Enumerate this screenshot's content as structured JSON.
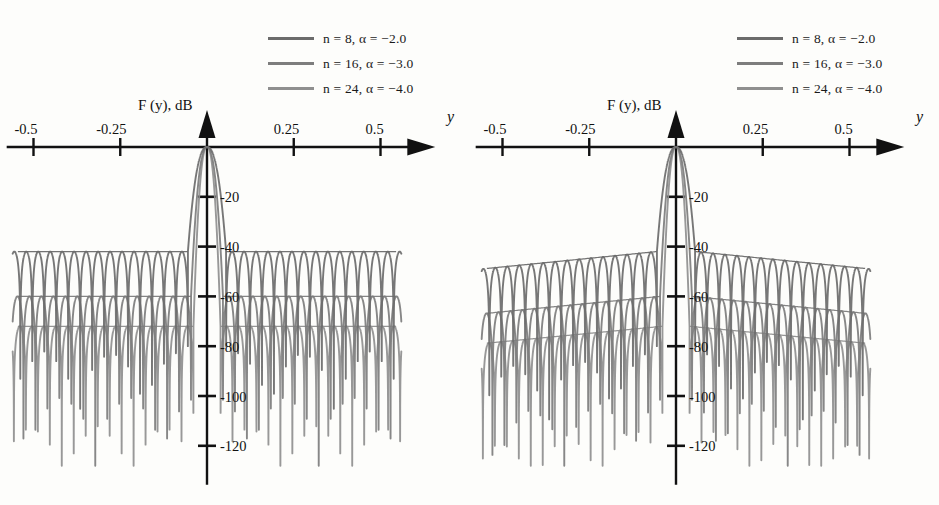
{
  "figure": {
    "background": "#fdfdfb",
    "panel_count": 2
  },
  "legend": {
    "position": "top-center-right",
    "entries": [
      {
        "label": "n = 8, α = −2.0",
        "n": 8,
        "alpha": -2.0,
        "color": "#6b6b6b"
      },
      {
        "label": "n = 16, α = −3.0",
        "n": 16,
        "alpha": -3.0,
        "color": "#7d7d7d"
      },
      {
        "label": "n = 24, α = −4.0",
        "n": 24,
        "alpha": -4.0,
        "color": "#8f8f8f"
      }
    ]
  },
  "axes": {
    "ylabel": "F (y), dB",
    "xlabel": "y",
    "xticks": [
      "-0.5",
      "-0.25",
      "0.25",
      "0.5"
    ],
    "xtick_values": [
      -0.5,
      -0.25,
      0.25,
      0.5
    ],
    "yticks": [
      "-20",
      "-40",
      "-60",
      "-80",
      "-100",
      "-120"
    ],
    "ytick_values": [
      -20,
      -40,
      -60,
      -80,
      -100,
      -120
    ],
    "xlim": [
      -0.56,
      0.56
    ],
    "ylim": [
      -130,
      2
    ],
    "grid": false,
    "arrow_heads": true
  },
  "chart_data": [
    {
      "type": "line",
      "title": "",
      "panel": "left",
      "xlabel": "y",
      "ylabel": "F (y), dB",
      "xlim": [
        -0.56,
        0.56
      ],
      "ylim": [
        -130,
        2
      ],
      "grid": false,
      "legend_position": "top-right",
      "envelope_slope_db": 0,
      "series": [
        {
          "name": "n = 8, α = −2.0",
          "n": 8,
          "alpha": -2.0,
          "color": "#6b6b6b",
          "peak_db": 0,
          "mainlobe_half_width_y": 0.055,
          "sidelobe_level_db": -42,
          "sidelobe_envelope": "flat",
          "null_depth_db": -126,
          "sidelobe_period_y": 0.0345,
          "first_null_y": 0.055
        },
        {
          "name": "n = 16, α = −3.0",
          "n": 16,
          "alpha": -3.0,
          "color": "#7d7d7d",
          "peak_db": 0,
          "mainlobe_half_width_y": 0.046,
          "sidelobe_level_db": -60,
          "sidelobe_envelope": "flat",
          "null_depth_db": -126,
          "sidelobe_period_y": 0.0345,
          "first_null_y": 0.046
        },
        {
          "name": "n = 24, α = −4.0",
          "n": 24,
          "alpha": -4.0,
          "color": "#8f8f8f",
          "peak_db": 0,
          "mainlobe_half_width_y": 0.039,
          "sidelobe_level_db": -72,
          "sidelobe_envelope": "flat",
          "null_depth_db": -126,
          "sidelobe_period_y": 0.0345,
          "first_null_y": 0.039
        }
      ]
    },
    {
      "type": "line",
      "title": "",
      "panel": "right",
      "xlabel": "y",
      "ylabel": "F (y), dB",
      "xlim": [
        -0.56,
        0.56
      ],
      "ylim": [
        -130,
        2
      ],
      "grid": false,
      "legend_position": "top-right",
      "envelope_slope_db": -7,
      "series": [
        {
          "name": "n = 8, α = −2.0",
          "n": 8,
          "alpha": -2.0,
          "color": "#6b6b6b",
          "peak_db": 0,
          "mainlobe_half_width_y": 0.055,
          "sidelobe_level_db": -42,
          "sidelobe_level_edge_db": -49,
          "sidelobe_envelope": "sloping-down",
          "null_depth_db": -126,
          "sidelobe_period_y": 0.0345,
          "first_null_y": 0.055
        },
        {
          "name": "n = 16, α = −3.0",
          "n": 16,
          "alpha": -3.0,
          "color": "#7d7d7d",
          "peak_db": 0,
          "mainlobe_half_width_y": 0.046,
          "sidelobe_level_db": -60,
          "sidelobe_level_edge_db": -67,
          "sidelobe_envelope": "sloping-down",
          "null_depth_db": -126,
          "sidelobe_period_y": 0.0345,
          "first_null_y": 0.046
        },
        {
          "name": "n = 24, α = −4.0",
          "n": 24,
          "alpha": -4.0,
          "color": "#8f8f8f",
          "peak_db": 0,
          "mainlobe_half_width_y": 0.039,
          "sidelobe_level_db": -72,
          "sidelobe_level_edge_db": -79,
          "sidelobe_envelope": "sloping-down",
          "null_depth_db": -126,
          "sidelobe_period_y": 0.0345,
          "first_null_y": 0.039
        }
      ]
    }
  ]
}
